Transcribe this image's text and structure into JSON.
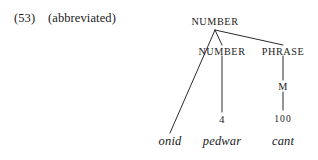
{
  "example": {
    "number": "(53)",
    "gloss": "(abbreviated)"
  },
  "tree": {
    "root": {
      "label": "NUMBER"
    },
    "nodes": [
      {
        "id": "number-root",
        "label": "NUMBER",
        "level": 0
      },
      {
        "id": "number-inner",
        "label": "NUMBER",
        "level": 1
      },
      {
        "id": "phrase",
        "label": "PHRASE",
        "level": 1
      },
      {
        "id": "m-feature",
        "label": "M",
        "level": 2
      },
      {
        "id": "numeral-4",
        "label": "4",
        "level": 3
      },
      {
        "id": "numeral-100",
        "label": "100",
        "level": 3
      }
    ],
    "terminals": [
      {
        "id": "terminal-onid",
        "label": "onid"
      },
      {
        "id": "terminal-pedwar",
        "label": "pedwar"
      },
      {
        "id": "terminal-cant",
        "label": "cant"
      }
    ]
  },
  "colors": {
    "ink": "#1a1a1a",
    "line": "#2b2b2b",
    "page": "#ffffff"
  }
}
